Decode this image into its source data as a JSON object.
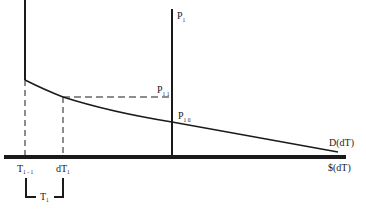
{
  "diagram": {
    "colors": {
      "ink": "#1a1a1a",
      "background": "#ffffff"
    },
    "labels": {
      "price_axis": {
        "main": "P",
        "sub": "1"
      },
      "p11": {
        "main": "P",
        "sub": "1 1"
      },
      "p10": {
        "main": "P",
        "sub": "1 0"
      },
      "demand_curve": "D(dT)",
      "x_axis": "$(dT)",
      "t_prev": {
        "main": "T",
        "sub": "1 - 1"
      },
      "dt1": {
        "main": "dT",
        "sub": "1"
      },
      "t1": {
        "main": "T",
        "sub": "1"
      }
    }
  }
}
